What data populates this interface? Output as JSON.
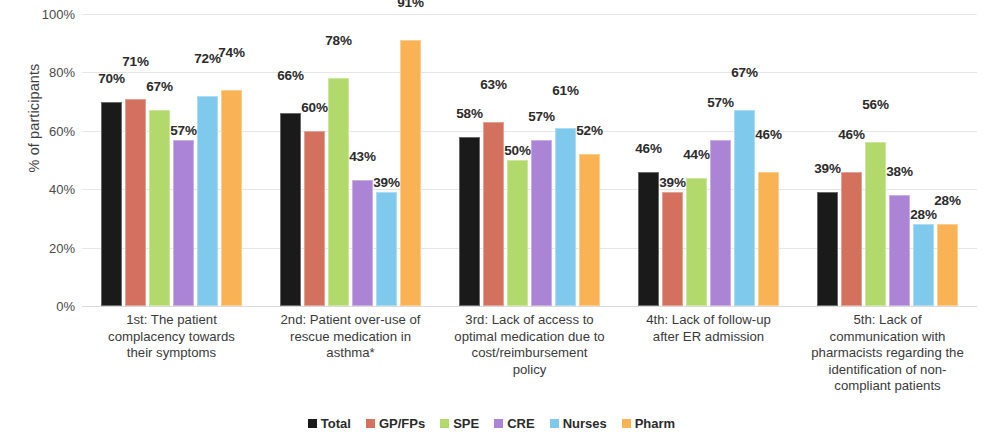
{
  "chart_data": {
    "type": "bar",
    "title": "",
    "xlabel": "",
    "ylabel": "% of participants",
    "ylim": [
      0,
      100
    ],
    "yticks": [
      "0%",
      "20%",
      "40%",
      "60%",
      "80%",
      "100%"
    ],
    "grid": true,
    "legend_position": "bottom",
    "categories": [
      "1st: The patient complacency towards their symptoms",
      "2nd:  Patient over-use of rescue medication in asthma*",
      "3rd: Lack of access to optimal medication due to cost/reimbursement policy",
      "4th: Lack of follow-up after ER admission",
      "5th:  Lack of communication with pharmacists regarding the identification of non-compliant patients"
    ],
    "category_lines": [
      [
        "1st: The patient",
        "complacency towards",
        "their symptoms"
      ],
      [
        "2nd:  Patient over-use of",
        "rescue medication in",
        "asthma*"
      ],
      [
        "3rd: Lack of access to",
        "optimal medication due to",
        "cost/reimbursement",
        "policy"
      ],
      [
        "4th: Lack of follow-up",
        "after ER admission"
      ],
      [
        "5th:  Lack of",
        "communication with",
        "pharmacists regarding the",
        "identification of non-",
        "compliant patients"
      ]
    ],
    "series": [
      {
        "name": "Total",
        "color": "#1a1a1a",
        "values": [
          70,
          66,
          58,
          46,
          39
        ],
        "labels": [
          "70%",
          "66%",
          "58%",
          "46%",
          "39%"
        ]
      },
      {
        "name": "GP/FPs",
        "color": "#d4715e",
        "values": [
          71,
          60,
          63,
          39,
          46
        ],
        "labels": [
          "71%",
          "60%",
          "63%",
          "39%",
          "46%"
        ]
      },
      {
        "name": "SPE",
        "color": "#b2d96b",
        "values": [
          67,
          78,
          50,
          44,
          56
        ],
        "labels": [
          "67%",
          "78%",
          "50%",
          "44%",
          "56%"
        ]
      },
      {
        "name": "CRE",
        "color": "#ab84d6",
        "values": [
          57,
          43,
          57,
          57,
          38
        ],
        "labels": [
          "57%",
          "43%",
          "57%",
          "57%",
          "38%"
        ]
      },
      {
        "name": "Nurses",
        "color": "#7fc9ec",
        "values": [
          72,
          39,
          61,
          67,
          28
        ],
        "labels": [
          "72%",
          "39%",
          "61%",
          "67%",
          "28%"
        ]
      },
      {
        "name": "Pharm",
        "color": "#f9b254",
        "values": [
          74,
          91,
          52,
          46,
          28
        ],
        "labels": [
          "74%",
          "91%",
          "52%",
          "46%",
          "28%"
        ]
      }
    ],
    "label_offsets": [
      [
        14,
        28,
        14,
        14,
        14
      ],
      [
        28,
        14,
        28,
        0,
        28
      ],
      [
        14,
        28,
        0,
        14,
        28
      ],
      [
        0,
        14,
        14,
        28,
        14
      ],
      [
        28,
        0,
        28,
        28,
        0
      ],
      [
        28,
        28,
        14,
        28,
        14
      ]
    ]
  }
}
